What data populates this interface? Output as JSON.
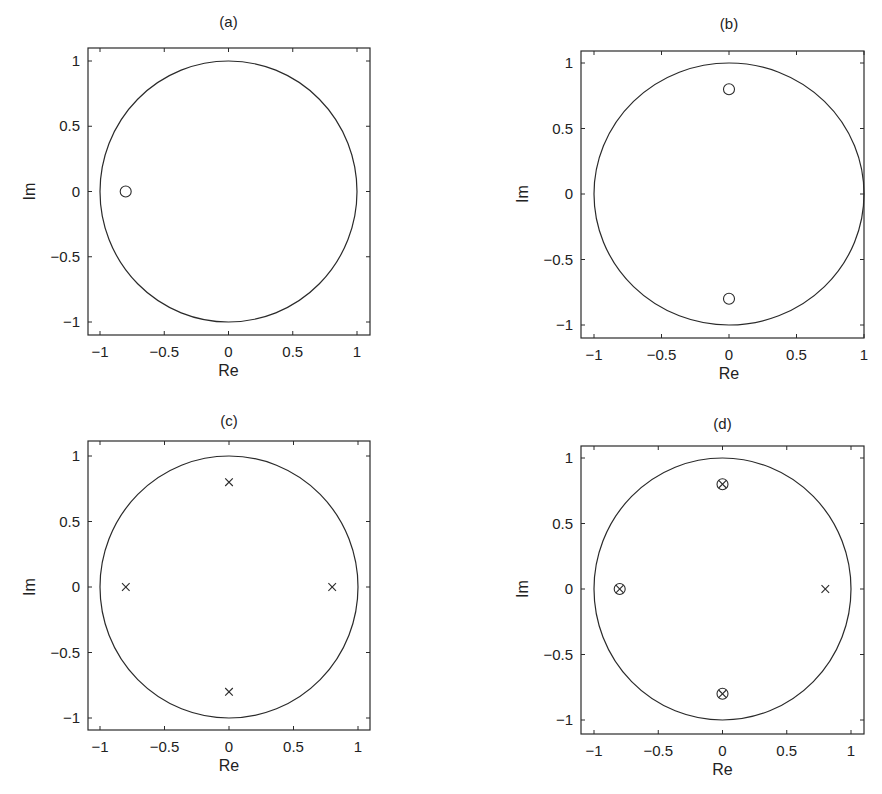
{
  "chart_data": [
    {
      "type": "scatter",
      "title": "(a)",
      "xlabel": "Re",
      "ylabel": "Im",
      "xlim": [
        -1.1,
        1.1
      ],
      "ylim": [
        -1.1,
        1.1
      ],
      "xticks": [
        "-1",
        "-0.5",
        "0",
        "0.5",
        "1"
      ],
      "yticks": [
        "1",
        "0.5",
        "0",
        "-0.5",
        "-1"
      ],
      "grid": false,
      "unit_circle": true,
      "zeros": [
        {
          "re": -0.8,
          "im": 0
        }
      ],
      "poles": []
    },
    {
      "type": "scatter",
      "title": "(b)",
      "xlabel": "Re",
      "ylabel": "Im",
      "xlim": [
        -1.1,
        1.0
      ],
      "ylim": [
        -1.1,
        1.1
      ],
      "xticks": [
        "-1",
        "-0.5",
        "0",
        "0.5",
        "1"
      ],
      "yticks": [
        "1",
        "0.5",
        "0",
        "-0.5",
        "-1"
      ],
      "grid": false,
      "unit_circle": true,
      "zeros": [
        {
          "re": 0,
          "im": 0.8
        },
        {
          "re": 0,
          "im": -0.8
        }
      ],
      "poles": []
    },
    {
      "type": "scatter",
      "title": "(c)",
      "xlabel": "Re",
      "ylabel": "Im",
      "xlim": [
        -1.1,
        1.1
      ],
      "ylim": [
        -1.1,
        1.1
      ],
      "xticks": [
        "-1",
        "-0.5",
        "0",
        "0.5",
        "1"
      ],
      "yticks": [
        "1",
        "0.5",
        "0",
        "-0.5",
        "-1"
      ],
      "grid": false,
      "unit_circle": true,
      "zeros": [],
      "poles": [
        {
          "re": 0,
          "im": 0.8
        },
        {
          "re": -0.8,
          "im": 0
        },
        {
          "re": 0.8,
          "im": 0
        },
        {
          "re": 0,
          "im": -0.8
        }
      ]
    },
    {
      "type": "scatter",
      "title": "(d)",
      "xlabel": "Re",
      "ylabel": "Im",
      "xlim": [
        -1.1,
        1.1
      ],
      "ylim": [
        -1.1,
        1.1
      ],
      "xticks": [
        "-1",
        "-0.5",
        "0",
        "0.5",
        "1"
      ],
      "yticks": [
        "1",
        "0.5",
        "0",
        "-0.5",
        "-1"
      ],
      "grid": false,
      "unit_circle": true,
      "zeros": [
        {
          "re": 0,
          "im": 0.8
        },
        {
          "re": -0.8,
          "im": 0
        },
        {
          "re": 0,
          "im": -0.8
        }
      ],
      "poles": [
        {
          "re": 0,
          "im": 0.8
        },
        {
          "re": -0.8,
          "im": 0
        },
        {
          "re": 0.8,
          "im": 0
        },
        {
          "re": 0,
          "im": -0.8
        }
      ]
    }
  ],
  "colors": {
    "line": "#2a2a2a",
    "background": "#ffffff"
  }
}
